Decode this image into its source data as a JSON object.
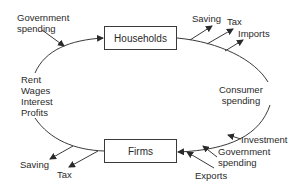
{
  "diagram": {
    "nodes": {
      "households": "Households",
      "firms": "Firms"
    },
    "flows": {
      "factor_income": [
        "Rent",
        "Wages",
        "Interest",
        "Profits"
      ],
      "consumer_spending": [
        "Consumer",
        "spending"
      ]
    },
    "leakages_households": {
      "saving": "Saving",
      "tax": "Tax",
      "imports": "Imports"
    },
    "leakages_firms": {
      "saving": "Saving",
      "tax": "Tax"
    },
    "injections_households": {
      "government_spending": [
        "Government",
        "spending"
      ]
    },
    "injections_firms": {
      "investment": "Investment",
      "government_spending": [
        "Government",
        "spending"
      ],
      "exports": "Exports"
    },
    "colors": {
      "line": "#3a3a3a",
      "text": "#2a2a2a",
      "background": "#ffffff"
    }
  }
}
